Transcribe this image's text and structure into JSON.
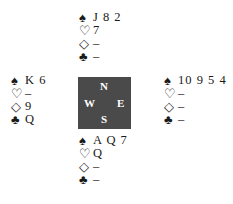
{
  "hands": {
    "north": {
      "spades": "J 8 2",
      "hearts": "7",
      "diamonds": "–",
      "clubs": "–"
    },
    "west": {
      "spades": "K 6",
      "hearts": "–",
      "diamonds": "9",
      "clubs": "Q"
    },
    "east": {
      "spades": "10 9 5 4",
      "hearts": "–",
      "diamonds": "–",
      "clubs": "–"
    },
    "south": {
      "spades": "A Q 7",
      "hearts": "Q",
      "diamonds": "–",
      "clubs": "–"
    }
  },
  "suit_icons": {
    "spades": "♠",
    "hearts": "♡",
    "diamonds": "◇",
    "clubs": "♣"
  },
  "compass": {
    "north": "N",
    "south": "S",
    "west": "W",
    "east": "E",
    "color": "#4a4a4a"
  }
}
